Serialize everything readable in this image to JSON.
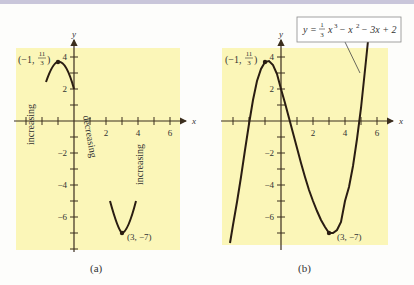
{
  "figure": {
    "panels": [
      {
        "id": "a",
        "caption": "(a)",
        "axis_x_label": "x",
        "axis_y_label": "y",
        "x_tick_labels": [
          "2",
          "4",
          "6"
        ],
        "y_tick_labels": [
          "4",
          "2",
          "-2",
          "-4",
          "-6"
        ],
        "max_point_label": "(−1, 11/3)",
        "min_point_label": "(3, −7)",
        "annotations": [
          "increasing",
          "decreasing",
          "increasing"
        ]
      },
      {
        "id": "b",
        "caption": "(b)",
        "axis_x_label": "x",
        "axis_y_label": "y",
        "x_tick_labels": [
          "2",
          "4",
          "6"
        ],
        "y_tick_labels": [
          "4",
          "2",
          "-2",
          "-4",
          "-6"
        ],
        "max_point_label": "(−1, 11/3)",
        "min_point_label": "(3, −7)",
        "equation_label": "y = 1/3 x³ − x² − 3x + 2"
      }
    ],
    "colors": {
      "panel_bg": "#fbf6b8",
      "curve": "#2a1d12",
      "axis": "#3b2e1e",
      "topbar": "#c9c6da"
    }
  },
  "labels": {
    "a_caption": "(a)",
    "b_caption": "(b)",
    "x": "x",
    "y": "y",
    "t2": "2",
    "t4": "4",
    "t6": "6",
    "ty4": "4",
    "ty2": "2",
    "tym2": "−2",
    "tym4": "−4",
    "tym6": "−6",
    "max_pre": "(−1,",
    "max_num": "11",
    "max_den": "3",
    "max_post": ")",
    "min": "(3, −7)",
    "increasing": "increasing",
    "decreasing": "decreasing",
    "eq_y": "y =",
    "eq_num": "1",
    "eq_den": "3",
    "eq_x3": "x",
    "eq_sup3": "3",
    "eq_mid": "− x",
    "eq_sup2": "2",
    "eq_rest": "− 3x + 2"
  }
}
